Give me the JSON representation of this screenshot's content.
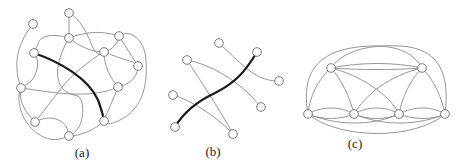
{
  "figure": {
    "colors": {
      "edge": "#8a8a8a",
      "highlight": "#1a1a1a",
      "node_fill": "#ffffff",
      "node_stroke": "#6a6a6a"
    },
    "node_radius": 4.3,
    "panels": [
      {
        "id": "a",
        "caption": "(a)",
        "caption_pos": [
          82,
          157
        ],
        "nodes": [
          [
            33,
            24
          ],
          [
            69,
            13
          ],
          [
            69,
            38
          ],
          [
            119,
            36
          ],
          [
            34,
            53
          ],
          [
            104,
            52
          ],
          [
            138,
            66
          ],
          [
            21,
            88
          ],
          [
            118,
            87
          ],
          [
            35,
            122
          ],
          [
            104,
            121
          ],
          [
            69,
            136
          ]
        ],
        "edges": [
          "M33,24 C25,34 15,50 17,70 C18,80 20,84 21,88",
          "M69,13 L69,38",
          "M69,13 C80,18 88,35 93,48 C97,55 100,56 104,52",
          "M69,38 C55,34 40,34 38,44 C36,48 35,50 34,53",
          "M69,38 C85,32 100,30 119,36",
          "M69,38 C78,45 90,52 104,52",
          "M69,38 C62,50 56,65 58,78 C60,90 68,94 78,96 C84,100 84,115 80,125 C76,132 72,135 69,136",
          "M119,36 C130,28 145,40 146,60 C148,90 140,110 120,120 C112,124 108,125 104,121",
          "M119,36 C118,44 112,50 104,52",
          "M119,36 C125,46 132,56 138,66",
          "M34,53 C40,60 38,72 32,80 C28,84 24,86 21,88",
          "M104,52 C112,55 125,60 133,62 C135,64 137,65 138,66",
          "M104,52 C90,60 70,75 56,95 C46,108 40,116 35,122",
          "M104,52 C104,65 110,78 118,87",
          "M138,66 C138,78 128,85 118,87",
          "M21,88 C50,92 90,100 118,87",
          "M21,88 C18,100 25,112 35,122",
          "M118,87 C114,98 108,110 104,121",
          "M35,122 C48,115 60,118 66,126 C68,130 68,133 69,136",
          "M69,136 C80,136 95,130 104,121",
          "M21,88 C15,100 22,125 40,135 C50,142 60,140 69,136"
        ],
        "highlight": [
          "M34,53 C60,62 88,78 98,100 C101,108 103,115 104,121"
        ]
      },
      {
        "id": "b",
        "caption": "(b)",
        "caption_pos": [
          213,
          156
        ],
        "nodes": [
          [
            219,
            43
          ],
          [
            257,
            52
          ],
          [
            187,
            60
          ],
          [
            279,
            81
          ],
          [
            173,
            95
          ],
          [
            261,
            107
          ],
          [
            175,
            127
          ],
          [
            233,
            134
          ]
        ],
        "edges": [
          "M219,43 C232,55 244,68 256,75 C265,80 272,81 279,81",
          "M187,60 C210,64 235,80 250,95 C255,100 258,104 261,107",
          "M187,60 C200,80 220,110 233,134",
          "M173,95 C190,100 215,115 233,134"
        ],
        "highlight": [
          "M175,127 C185,110 200,100 215,93 C235,83 245,72 257,52"
        ]
      },
      {
        "id": "c",
        "caption": "(c)",
        "caption_pos": [
          355,
          148
        ],
        "nodes": [
          [
            331,
            68
          ],
          [
            422,
            68
          ],
          [
            308,
            114
          ],
          [
            354,
            114
          ],
          [
            399,
            114
          ],
          [
            445,
            114
          ]
        ],
        "edges": [
          "M308,114 C300,70 320,48 370,46 C400,45 415,55 422,68",
          "M331,68 C340,55 360,44 400,46 C440,48 450,75 445,114",
          "M331,68 C360,62 395,62 422,68",
          "M331,68 C360,70 395,70 422,68",
          "M331,68 C318,80 310,95 308,114",
          "M331,68 C342,80 350,98 354,114",
          "M331,68 C360,75 390,95 399,114",
          "M422,68 C390,75 365,95 354,114",
          "M422,68 C410,80 402,98 399,114",
          "M422,68 C434,80 442,98 445,114",
          "M308,114 C322,106 340,106 354,114",
          "M308,114 C322,120 340,120 354,114",
          "M354,114 C368,106 386,106 399,114",
          "M354,114 C368,120 386,120 399,114",
          "M399,114 C414,106 432,106 445,114",
          "M399,114 C414,120 432,120 445,114",
          "M308,114 C335,125 370,127 399,114",
          "M354,114 C385,127 420,125 445,114",
          "M308,114 C340,140 415,140 445,114"
        ],
        "highlight": []
      }
    ]
  }
}
